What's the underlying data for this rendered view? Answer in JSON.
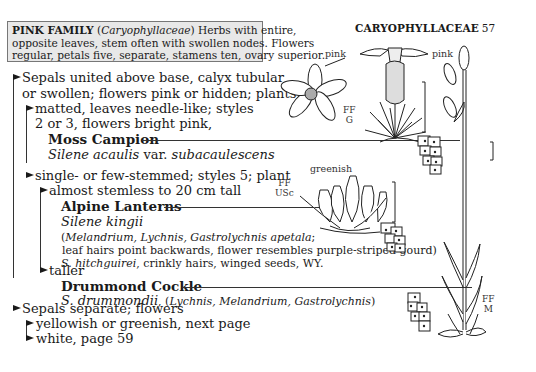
{
  "family_box": {
    "title": "PINK FAMILY",
    "latin": "Caryophyllaceae",
    "line1_rest": " Herbs with entire,",
    "line2": "opposite leaves, stem often with swollen nodes. Flowers",
    "line3": "regular, petals five, separate, stamens ten, ovary superior."
  },
  "page_header": {
    "family": "CARYOPHYLLACEAE",
    "page_number": "57"
  },
  "key": {
    "a1": {
      "line1": "Sepals united above base, calyx tubular",
      "line2": "or swollen; flowers pink or hidden; plants"
    },
    "b1": {
      "line1": "matted, leaves  needle-like; styles",
      "line2": "2 or 3, flowers bright pink,"
    },
    "moss_campion": {
      "common": "Moss Campion",
      "genus_species": "Silene acaulis",
      "var_text": " var. ",
      "variety": "subacaulescens"
    },
    "b2": {
      "line1": "single- or few-stemmed; styles 5; plant"
    },
    "c1": {
      "line1": "almost stemless to 20 cm tall"
    },
    "alpine_lanterns": {
      "common": "Alpine Lanterns",
      "scientific": "Silene kingii",
      "syn_open": "(",
      "synonyms": "Melandrium, Lychnis, Gastrolychnis apetala",
      "syn_close": ";",
      "note": " leaf hairs point backwards, flower resembles purple-striped gourd)",
      "related_sci": "S. hitchguirei",
      "related_note": ", crinkly hairs, winged seeds, WY."
    },
    "c2": {
      "line1": "taller"
    },
    "drummond_cockle": {
      "common": "Drummond Cockle",
      "scientific": "S. drummondii",
      "sep": ", (",
      "synonyms": "Lychnis, Melandrium, Gastrolychnis",
      "close": ")"
    },
    "a2": {
      "line1": "Sepals separate; flowers"
    },
    "d1": {
      "line1": "yellowish or greenish, next page"
    },
    "d2": {
      "line1": "white, page 59"
    }
  },
  "illustrations": {
    "moss_campion": {
      "color_label": "pink",
      "code_line1": "FF",
      "code_line2": "G"
    },
    "alpine_lanterns": {
      "color_label": "greenish",
      "code_line1": "FF",
      "code_line2": "USc"
    },
    "drummond_cockle": {
      "color_label": "pink",
      "code_line1": "FF",
      "code_line2": "M"
    }
  }
}
